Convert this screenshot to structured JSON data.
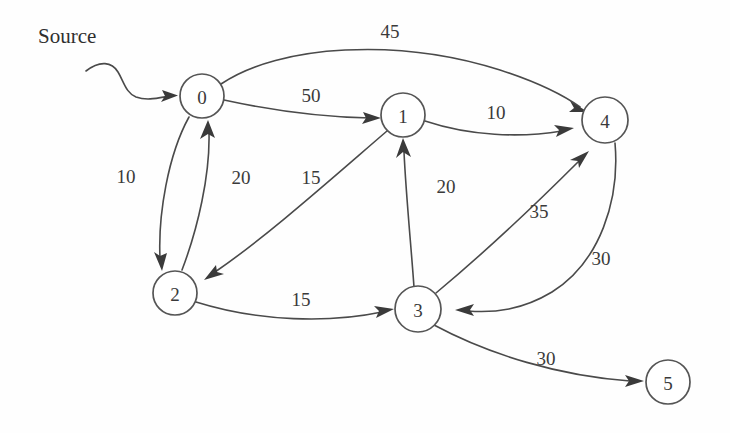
{
  "diagram": {
    "source_annotation": {
      "label": "Source",
      "points_to_node": "0"
    },
    "colors": {
      "background": "#fefefe",
      "stroke": "#4a4a4a",
      "node_stroke": "#555555",
      "node_fill": "#ffffff",
      "text": "#3a3a3a"
    },
    "nodes": [
      {
        "id": "0",
        "label": "0",
        "cx": 202,
        "cy": 96,
        "r": 22
      },
      {
        "id": "1",
        "label": "1",
        "cx": 403,
        "cy": 115,
        "r": 22
      },
      {
        "id": "2",
        "label": "2",
        "cx": 175,
        "cy": 293,
        "r": 22
      },
      {
        "id": "3",
        "label": "3",
        "cx": 418,
        "cy": 309,
        "r": 23
      },
      {
        "id": "4",
        "label": "4",
        "cx": 605,
        "cy": 120,
        "r": 23
      },
      {
        "id": "5",
        "label": "5",
        "cx": 668,
        "cy": 382,
        "r": 22
      }
    ],
    "edges": [
      {
        "from": "0",
        "to": "4",
        "weight": "45",
        "label_x": 390,
        "label_y": 31
      },
      {
        "from": "0",
        "to": "1",
        "weight": "50",
        "label_x": 311,
        "label_y": 95
      },
      {
        "from": "1",
        "to": "4",
        "weight": "10",
        "label_x": 496,
        "label_y": 112
      },
      {
        "from": "0",
        "to": "2",
        "weight": "10",
        "label_x": 126,
        "label_y": 176
      },
      {
        "from": "2",
        "to": "0",
        "weight": "20",
        "label_x": 241,
        "label_y": 177
      },
      {
        "from": "1",
        "to": "2",
        "weight": "15",
        "label_x": 311,
        "label_y": 177
      },
      {
        "from": "3",
        "to": "1",
        "weight": "20",
        "label_x": 446,
        "label_y": 186
      },
      {
        "from": "3",
        "to": "4",
        "weight": "35",
        "label_x": 539,
        "label_y": 211
      },
      {
        "from": "4",
        "to": "3",
        "weight": "30",
        "label_x": 601,
        "label_y": 258
      },
      {
        "from": "2",
        "to": "3",
        "weight": "15",
        "label_x": 301,
        "label_y": 299
      },
      {
        "from": "3",
        "to": "5",
        "weight": "30",
        "label_x": 546,
        "label_y": 358
      }
    ]
  }
}
